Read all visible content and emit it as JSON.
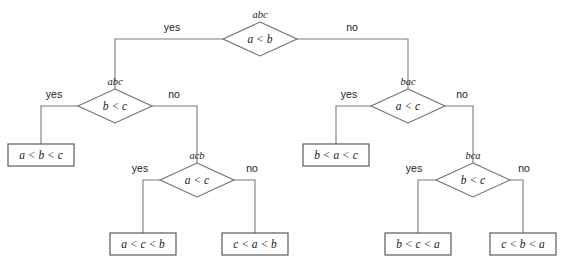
{
  "diagram": {
    "type": "decision-tree",
    "colors": {
      "line": "#7a7a7a",
      "box_border": "#5a5a5a",
      "text": "#1b1b1b",
      "background": "#ffffff"
    },
    "branch_labels": {
      "yes": "yes",
      "no": "no"
    },
    "nodes": [
      {
        "id": "root",
        "permutation": "abc",
        "condition": "a < b",
        "cx": 260,
        "cy": 39,
        "rx": 37,
        "ry": 17,
        "yes_label": "yes",
        "no_label": "no"
      },
      {
        "id": "left-bc",
        "permutation": "abc",
        "condition": "b < c",
        "cx": 115,
        "cy": 106,
        "rx": 37,
        "ry": 17,
        "yes_label": "yes",
        "no_label": "no"
      },
      {
        "id": "left-acb",
        "permutation": "acb",
        "condition": "a < c",
        "cx": 197,
        "cy": 180,
        "rx": 37,
        "ry": 17,
        "yes_label": "yes",
        "no_label": "no"
      },
      {
        "id": "right-ac",
        "permutation": "bac",
        "condition": "a < c",
        "cx": 408,
        "cy": 106,
        "rx": 37,
        "ry": 17,
        "yes_label": "yes",
        "no_label": "no"
      },
      {
        "id": "right-bca",
        "permutation": "bca",
        "condition": "b < c",
        "cx": 473,
        "cy": 180,
        "rx": 37,
        "ry": 17,
        "yes_label": "yes",
        "no_label": "no"
      }
    ],
    "leaves": [
      {
        "id": "leaf-abc",
        "label": "a < b < c",
        "x": 8,
        "y": 144,
        "w": 66,
        "h": 22
      },
      {
        "id": "leaf-acb",
        "label": "a < c < b",
        "x": 110,
        "y": 233,
        "w": 66,
        "h": 22
      },
      {
        "id": "leaf-cab",
        "label": "c < a < b",
        "x": 222,
        "y": 233,
        "w": 66,
        "h": 22
      },
      {
        "id": "leaf-bac",
        "label": "b < a < c",
        "x": 303,
        "y": 144,
        "w": 66,
        "h": 22
      },
      {
        "id": "leaf-bca",
        "label": "b < c < a",
        "x": 385,
        "y": 233,
        "w": 66,
        "h": 22
      },
      {
        "id": "leaf-cba",
        "label": "c < b < a",
        "x": 490,
        "y": 233,
        "w": 66,
        "h": 22
      }
    ],
    "edges": [
      {
        "id": "edge-root-yes",
        "branch": "yes",
        "path": "M 223 39 L 115 39 L 115 89",
        "label_x": 172,
        "label_y": 31
      },
      {
        "id": "edge-root-no",
        "branch": "no",
        "path": "M 297 39 L 408 39 L 408 89",
        "label_x": 352,
        "label_y": 31
      },
      {
        "id": "edge-lbc-yes",
        "branch": "yes",
        "path": "M 78 106 L 41 106 L 41 144",
        "label_x": 54,
        "label_y": 98
      },
      {
        "id": "edge-lbc-no",
        "branch": "no",
        "path": "M 152 106 L 197 106 L 197 163",
        "label_x": 174,
        "label_y": 98
      },
      {
        "id": "edge-lacb-yes",
        "branch": "yes",
        "path": "M 160 180 L 143 180 L 143 233",
        "label_x": 140,
        "label_y": 172
      },
      {
        "id": "edge-lacb-no",
        "branch": "no",
        "path": "M 234 180 L 255 180 L 255 233",
        "label_x": 252,
        "label_y": 172
      },
      {
        "id": "edge-rac-yes",
        "branch": "yes",
        "path": "M 371 106 L 336 106 L 336 144",
        "label_x": 349,
        "label_y": 98
      },
      {
        "id": "edge-rac-no",
        "branch": "no",
        "path": "M 445 106 L 473 106 L 473 163",
        "label_x": 462,
        "label_y": 98
      },
      {
        "id": "edge-rbca-yes",
        "branch": "yes",
        "path": "M 436 180 L 418 180 L 418 233",
        "label_x": 414,
        "label_y": 172
      },
      {
        "id": "edge-rbca-no",
        "branch": "no",
        "path": "M 510 180 L 523 180 L 523 233",
        "label_x": 524,
        "label_y": 172
      }
    ]
  }
}
